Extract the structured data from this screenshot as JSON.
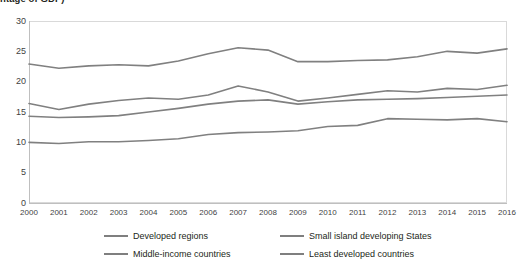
{
  "chart_data": {
    "type": "line",
    "title": "ntage of GDP)",
    "xlabel": "",
    "ylabel": "",
    "ylim": [
      0,
      30
    ],
    "yticks": [
      0,
      5,
      10,
      15,
      20,
      25,
      30
    ],
    "grid": false,
    "legend_position": "bottom",
    "categories": [
      "2000",
      "2001",
      "2002",
      "2003",
      "2004",
      "2005",
      "2006",
      "2007",
      "2008",
      "2009",
      "2010",
      "2011",
      "2012",
      "2013",
      "2014",
      "2015",
      "2016"
    ],
    "series": [
      {
        "name": "Developed regions",
        "color": "#808080",
        "values": [
          22.9,
          22.2,
          22.6,
          22.8,
          22.6,
          23.4,
          24.6,
          25.6,
          25.2,
          23.3,
          23.3,
          23.5,
          23.6,
          24.1,
          25.0,
          24.7,
          25.4
        ]
      },
      {
        "name": "Small island developing States",
        "color": "#808080",
        "values": [
          16.4,
          15.4,
          16.3,
          16.9,
          17.3,
          17.1,
          17.8,
          19.3,
          18.3,
          16.8,
          17.3,
          17.9,
          18.5,
          18.3,
          18.9,
          18.7,
          19.4
        ]
      },
      {
        "name": "Middle-income countries",
        "color": "#808080",
        "values": [
          14.3,
          14.1,
          14.2,
          14.4,
          15.0,
          15.6,
          16.3,
          16.8,
          17.0,
          16.3,
          16.7,
          17.0,
          17.1,
          17.2,
          17.4,
          17.6,
          17.8
        ]
      },
      {
        "name": "Least developed countries",
        "color": "#808080",
        "values": [
          10.0,
          9.8,
          10.1,
          10.1,
          10.3,
          10.6,
          11.3,
          11.6,
          11.7,
          11.9,
          12.6,
          12.8,
          13.9,
          13.8,
          13.7,
          13.9,
          13.4
        ]
      }
    ]
  },
  "legend": {
    "items": [
      {
        "label": "Developed regions"
      },
      {
        "label": "Small island developing States"
      },
      {
        "label": "Middle-income countries"
      },
      {
        "label": "Least developed countries"
      }
    ]
  }
}
